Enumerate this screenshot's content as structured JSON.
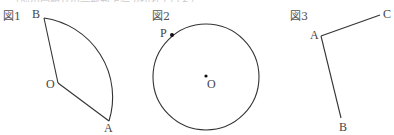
{
  "cutoff_text": "…（前の問題文の一部が上端で切れている）…",
  "figures": [
    {
      "id": "fig1",
      "label": "図1",
      "shape": "sector",
      "points": {
        "O": "O",
        "A": "A",
        "B": "B"
      }
    },
    {
      "id": "fig2",
      "label": "図2",
      "shape": "circle",
      "points": {
        "P": "P",
        "O": "O"
      }
    },
    {
      "id": "fig3",
      "label": "図3",
      "shape": "angle",
      "points": {
        "A": "A",
        "B": "B",
        "C": "C"
      }
    }
  ],
  "colors": {
    "stroke": "#333333",
    "text": "#444444"
  }
}
